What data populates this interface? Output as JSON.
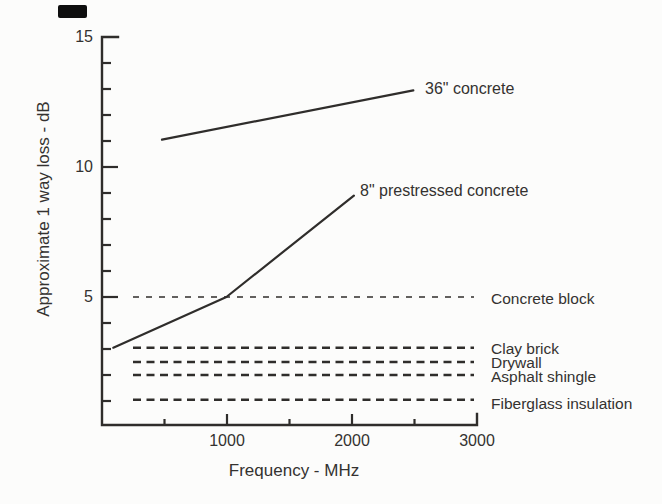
{
  "figure": {
    "background_color": "#fcfcfb",
    "ink_color": "#2f2d2b",
    "artifact_present": true
  },
  "axis_titles": {
    "x": "Frequency - MHz",
    "y": "Approximate 1 way loss - dB"
  },
  "chart_data": {
    "type": "line",
    "title": "",
    "xlabel": "Frequency - MHz",
    "ylabel": "Approximate 1 way loss - dB",
    "xlim": [
      0,
      3000
    ],
    "ylim": [
      0,
      15
    ],
    "grid": false,
    "legend_position": "inline-labels",
    "x_major_ticks": [
      1000,
      2000,
      3000
    ],
    "x_minor_ticks": [
      500,
      1500,
      2500
    ],
    "y_major_ticks": [
      15,
      10,
      5
    ],
    "y_minor_ticks": [
      1,
      2,
      3,
      4,
      6,
      7,
      8,
      9,
      11,
      12,
      13,
      14
    ],
    "series": [
      {
        "name": "36\" concrete",
        "line_style": "solid",
        "points_mhz_db": [
          [
            480,
            11.05
          ],
          [
            2490,
            12.95
          ]
        ]
      },
      {
        "name": "8\" prestressed concrete",
        "line_style": "solid",
        "points_mhz_db": [
          [
            90,
            3.05
          ],
          [
            995,
            5.0
          ],
          [
            2015,
            8.9
          ]
        ]
      }
    ],
    "reference_lines": [
      {
        "name": "Concrete block",
        "db": 5.0,
        "weight": "thin"
      },
      {
        "name": "Clay brick",
        "db": 3.05,
        "weight": "bold"
      },
      {
        "name": "Drywall",
        "db": 2.5,
        "weight": "bold"
      },
      {
        "name": "Asphalt shingle",
        "db": 2.0,
        "weight": "bold"
      },
      {
        "name": "Fiberglass insulation",
        "db": 1.05,
        "weight": "bold"
      }
    ]
  }
}
